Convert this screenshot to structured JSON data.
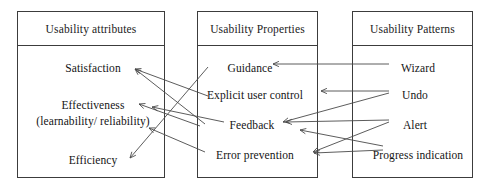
{
  "diagram": {
    "title_visible": false,
    "columns": [
      {
        "id": "usability-attributes",
        "header": "Usability attributes",
        "box": {
          "x": 17,
          "y": 11,
          "w": 148,
          "h": 167
        },
        "nodes": [
          {
            "id": "satisfaction",
            "label": "Satisfaction",
            "x": 93,
            "y": 62
          },
          {
            "id": "effectiveness",
            "label": "Effectiveness",
            "x": 93,
            "y": 99
          },
          {
            "id": "effectiveness-sub",
            "label": "(learnability/ reliability)",
            "x": 93,
            "y": 114
          },
          {
            "id": "efficiency",
            "label": "Efficiency",
            "x": 93,
            "y": 154
          }
        ]
      },
      {
        "id": "usability-properties",
        "header": "Usability Properties",
        "box": {
          "x": 197,
          "y": 11,
          "w": 121,
          "h": 167
        },
        "nodes": [
          {
            "id": "guidance",
            "label": "Guidance",
            "x": 250,
            "y": 62
          },
          {
            "id": "explicit-user-control",
            "label": "Explicit user control",
            "x": 255,
            "y": 89
          },
          {
            "id": "feedback",
            "label": "Feedback",
            "x": 252,
            "y": 119
          },
          {
            "id": "error-prevention",
            "label": "Error prevention",
            "x": 255,
            "y": 149
          }
        ]
      },
      {
        "id": "usability-patterns",
        "header": "Usability Patterns",
        "box": {
          "x": 352,
          "y": 11,
          "w": 121,
          "h": 167
        },
        "nodes": [
          {
            "id": "wizard",
            "label": "Wizard",
            "x": 418,
            "y": 62
          },
          {
            "id": "undo",
            "label": "Undo",
            "x": 415,
            "y": 89
          },
          {
            "id": "alert",
            "label": "Alert",
            "x": 415,
            "y": 119
          },
          {
            "id": "progress-indication",
            "label": "Progress indication",
            "x": 418,
            "y": 149
          }
        ]
      }
    ],
    "arrows": [
      {
        "id": "guidance-to-satisfaction",
        "from": "guidance",
        "to": "satisfaction",
        "x1": 208,
        "y1": 96,
        "x2": 135,
        "y2": 69
      },
      {
        "id": "guidance-to-efficiency",
        "from": "guidance",
        "to": "efficiency",
        "x1": 208,
        "y1": 67,
        "x2": 130,
        "y2": 158
      },
      {
        "id": "explicit-user-control-to-effectiveness",
        "from": "explicit-user-control",
        "to": "effectiveness",
        "x1": 200,
        "y1": 126,
        "x2": 139,
        "y2": 104
      },
      {
        "id": "feedback-to-satisfaction",
        "from": "feedback",
        "to": "satisfaction",
        "x1": 205,
        "y1": 124,
        "x2": 135,
        "y2": 69
      },
      {
        "id": "feedback-to-effectiveness",
        "from": "feedback",
        "to": "effectiveness",
        "x1": 224,
        "y1": 122,
        "x2": 152,
        "y2": 107
      },
      {
        "id": "error-prevention-to-effectiveness",
        "from": "error-prevention",
        "to": "effectiveness",
        "x1": 205,
        "y1": 152,
        "x2": 149,
        "y2": 128
      },
      {
        "id": "wizard-to-guidance",
        "from": "wizard",
        "to": "guidance",
        "x1": 389,
        "y1": 64,
        "x2": 273,
        "y2": 64
      },
      {
        "id": "undo-to-explicit-user-control",
        "from": "undo",
        "to": "explicit-user-control",
        "x1": 389,
        "y1": 91,
        "x2": 321,
        "y2": 91
      },
      {
        "id": "undo-to-feedback",
        "from": "undo",
        "to": "feedback",
        "x1": 389,
        "y1": 93,
        "x2": 283,
        "y2": 122
      },
      {
        "id": "alert-to-feedback",
        "from": "alert",
        "to": "feedback",
        "x1": 389,
        "y1": 120,
        "x2": 286,
        "y2": 122
      },
      {
        "id": "alert-to-error-prevention",
        "from": "alert",
        "to": "error-prevention",
        "x1": 389,
        "y1": 122,
        "x2": 313,
        "y2": 152
      },
      {
        "id": "progress-indication-to-feedback",
        "from": "progress-indication",
        "to": "feedback",
        "x1": 383,
        "y1": 146,
        "x2": 300,
        "y2": 130
      },
      {
        "id": "progress-indication-to-error-prevention",
        "from": "progress-indication",
        "to": "error-prevention",
        "x1": 383,
        "y1": 150,
        "x2": 314,
        "y2": 153
      }
    ],
    "style": {
      "line_color": "#4a4a4a",
      "border_color": "#3c3c3c",
      "text_color": "#141414",
      "background": "#ffffff"
    }
  }
}
